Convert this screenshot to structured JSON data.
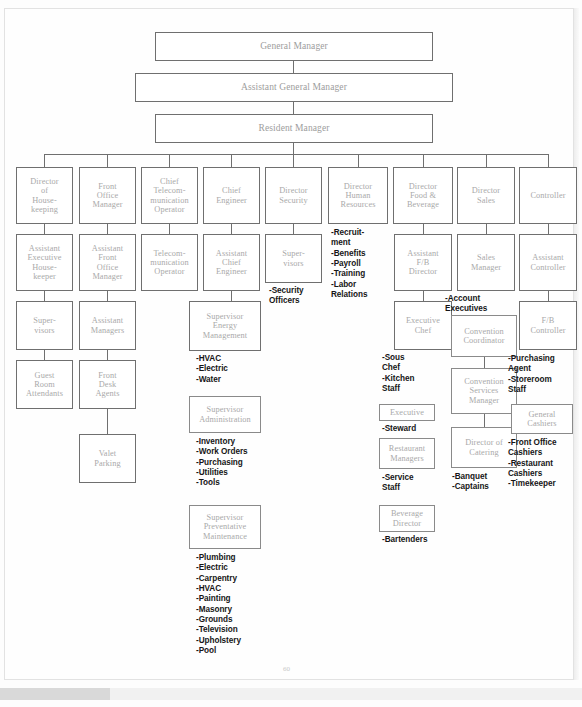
{
  "document": {
    "type": "hotel-organizational-chart",
    "page_number": "60"
  },
  "top_chain": [
    {
      "label": "General Manager"
    },
    {
      "label": "Assistant General Manager"
    },
    {
      "label": "Resident Manager"
    }
  ],
  "departments": [
    {
      "label": "Director\nof\nHouse-\nkeeping"
    },
    {
      "label": "Front\nOffice\nManager"
    },
    {
      "label": "Chief\nTelecom-\nmunication\nOperator"
    },
    {
      "label": "Chief\nEngineer"
    },
    {
      "label": "Director\nSecurity"
    },
    {
      "label": "Director\nHuman\nResources"
    },
    {
      "label": "Director\nFood &\nBeverage"
    },
    {
      "label": "Director\nSales"
    },
    {
      "label": "Controller"
    }
  ],
  "housekeeping": {
    "assistant": "Assistant\nExecutive\nHouse-\nkeeper",
    "supervisors": "Super-\nvisors",
    "attendants": "Guest\nRoom\nAttendants"
  },
  "front_office": {
    "assistant": "Assistant\nFront\nOffice\nManager",
    "managers": "Assistant\nManagers",
    "agents": "Front\nDesk\nAgents",
    "valet": "Valet\nParking"
  },
  "telecom": {
    "operator": "Telecom-\nmunication\nOperator"
  },
  "engineering": {
    "assistant": "Assistant\nChief\nEngineer",
    "energy": "Supervisor\nEnergy\nManagement",
    "energy_items": "-HVAC\n-Electric\n-Water",
    "administration": "Supervisor\nAdministration",
    "administration_items": "-Inventory\n-Work Orders\n-Purchasing\n-Utilities\n-Tools",
    "preventative": "Supervisor\nPreventative\nMaintenance",
    "preventative_items": "-Plumbing\n-Electric\n-Carpentry\n-HVAC\n-Painting\n-Masonry\n-Grounds\n-Television\n-Upholstery\n-Pool"
  },
  "security": {
    "supervisors": "Super-\nvisors",
    "items": "-Security\n Officers"
  },
  "human_resources": {
    "items": "-Recruit-\n ment\n-Benefits\n-Payroll\n-Training\n-Labor\n Relations"
  },
  "food_beverage": {
    "assistant": "Assistant\nF/B\nDirector",
    "executive_chef": "Executive\nChef",
    "executive_chef_items": "-Sous\n Chef\n-Kitchen\n Staff",
    "executive": "Executive",
    "executive_items": "-Steward",
    "restaurant_managers": "Restaurant\nManagers",
    "restaurant_items": "-Service\n Staff",
    "beverage_director": "Beverage\nDirector",
    "beverage_items": "-Bartenders"
  },
  "sales": {
    "manager": "Sales\nManager",
    "manager_items": "-Account\n Executives",
    "convention_coordinator": "Convention\nCoordinator",
    "convention_services": "Convention\nServices\nManager",
    "director_catering": "Director of\nCatering",
    "catering_items": "-Banquet\n-Captains"
  },
  "controller": {
    "assistant": "Assistant\nController",
    "fb_controller": "F/B\nController",
    "fb_items": "-Purchasing\n Agent\n-Storeroom\n Staff",
    "general_cashiers": "General\nCashiers",
    "cashier_items": "-Front Office\n Cashiers\n-Restaurant\n Cashiers\n-Timekeeper"
  }
}
